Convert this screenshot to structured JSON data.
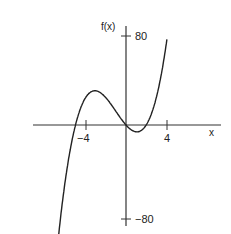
{
  "chart_data": {
    "type": "line",
    "title": "",
    "xlabel": "x",
    "ylabel": "f(x)",
    "function": "x^3 + 3x^2 - 10x",
    "x_ticks": [
      -4,
      4
    ],
    "x_tick_labels": [
      "−4",
      "4"
    ],
    "y_ticks": [
      80,
      -80
    ],
    "y_tick_labels": [
      "80",
      "−80"
    ],
    "xlim": [
      -9.5,
      10
    ],
    "ylim": [
      -85,
      90
    ],
    "grid": false,
    "legend": null,
    "series": [
      {
        "name": "f(x)",
        "x": [
          -6.7,
          -6.0,
          -5.0,
          -4.0,
          -3.0,
          -2.7,
          -2.0,
          -1.0,
          0.0,
          1.0,
          2.0,
          3.0,
          4.0,
          4.05
        ],
        "values": [
          -80.6,
          -48.0,
          0.0,
          24.0,
          30.0,
          29.5,
          24.0,
          12.0,
          0.0,
          -6.0,
          0.0,
          24.0,
          72.0,
          75.0
        ]
      }
    ],
    "annotations": [
      {
        "text": "f(x)",
        "position": "top of y-axis"
      },
      {
        "text": "x",
        "position": "right end of x-axis"
      }
    ]
  },
  "labels": {
    "y_axis": "f(x)",
    "x_axis": "x",
    "y_top": "80",
    "y_bottom": "−80",
    "x_neg": "−4",
    "x_pos": "4"
  },
  "colors": {
    "axis": "#333333",
    "curve": "#222222",
    "background": "#ffffff"
  }
}
